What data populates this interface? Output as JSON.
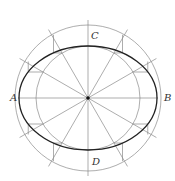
{
  "diagram": {
    "type": "ellipse-construction-concentric-circles",
    "center": [
      88,
      98
    ],
    "outer_radius": 73,
    "inner_radius": 52,
    "ellipse": {
      "rx": 69,
      "ry": 52
    },
    "spoke_angles_deg": [
      0,
      30,
      60,
      90,
      120,
      150
    ],
    "colors": {
      "thin": "#8a8a8a",
      "ellipse": "#222222",
      "center": "#111111"
    }
  },
  "labels": {
    "A": {
      "text": "A",
      "x": 10,
      "y": 93
    },
    "B": {
      "text": "B",
      "x": 164,
      "y": 93
    },
    "C": {
      "text": "C",
      "x": 91,
      "y": 31
    },
    "D": {
      "text": "D",
      "x": 92,
      "y": 157
    }
  }
}
